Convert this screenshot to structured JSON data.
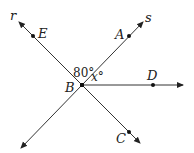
{
  "diagram": {
    "type": "geometry",
    "lines": [
      {
        "name": "r",
        "label": "r",
        "points": [
          "E",
          "B",
          "C"
        ]
      },
      {
        "name": "s",
        "label": "s",
        "points": [
          "A",
          "B"
        ]
      }
    ],
    "rays": [
      {
        "name": "BD",
        "from": "B",
        "through": "D"
      }
    ],
    "points": {
      "A": {
        "label": "A"
      },
      "B": {
        "label": "B"
      },
      "C": {
        "label": "C"
      },
      "D": {
        "label": "D"
      },
      "E": {
        "label": "E"
      }
    },
    "angles": {
      "angle_ABE": {
        "label": "80°",
        "value": 80
      },
      "angle_ABD": {
        "label_var": "x",
        "label_deg": "°"
      }
    }
  }
}
